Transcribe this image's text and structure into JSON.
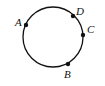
{
  "diagram": {
    "type": "circle-with-points",
    "circle": {
      "cx": 53,
      "cy": 37,
      "r": 30,
      "stroke": "#111111"
    },
    "points": [
      {
        "label": "A",
        "x": 26,
        "y": 25,
        "lx": 15,
        "ly": 26
      },
      {
        "label": "D",
        "x": 73,
        "y": 16,
        "lx": 76,
        "ly": 15
      },
      {
        "label": "C",
        "x": 83,
        "y": 35,
        "lx": 87,
        "ly": 33
      },
      {
        "label": "B",
        "x": 68,
        "y": 64,
        "lx": 64,
        "ly": 78
      }
    ],
    "colors": {
      "ink": "#111111",
      "background": "#ffffff"
    }
  }
}
